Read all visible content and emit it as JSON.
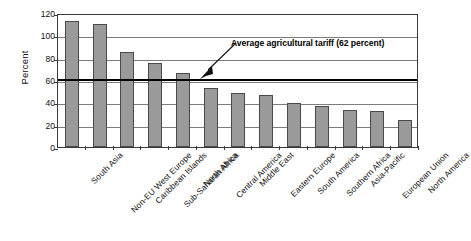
{
  "chart_data": {
    "type": "bar",
    "title": "",
    "xlabel": "",
    "ylabel": "Percent",
    "ylim": [
      0,
      120
    ],
    "ystep": 20,
    "yticks": [
      120,
      100,
      80,
      60,
      40,
      20,
      0
    ],
    "grid": true,
    "legend": null,
    "categories": [
      "South Asia",
      "Non-EU West Europe",
      "Caribbean Islands",
      "Sub-Saharan Africa",
      "North Africa",
      "Central America",
      "Middle East",
      "Eastern Europe",
      "South America",
      "Southern Africa",
      "Asia-Pacific",
      "European Union",
      "North America"
    ],
    "values": [
      113,
      110,
      85,
      75,
      66,
      53,
      48,
      47,
      39,
      37,
      33,
      32,
      24
    ],
    "bar_color": "#9a9a9a",
    "bar_edge_color": "#4a4a4a",
    "reference_line": {
      "value": 62,
      "label": "Average agricultural tariff (62 percent)",
      "color": "#000000"
    },
    "annotations": [
      {
        "name": "average-tariff-annotation",
        "text": "Average agricultural tariff (62 percent)",
        "points_to": 62
      }
    ]
  },
  "axis": {
    "y_title": "Percent",
    "y_ticks": [
      "120",
      "100",
      "80",
      "60",
      "40",
      "20",
      "0"
    ]
  },
  "annotation": {
    "text": "Average agricultural tariff (62 percent)"
  },
  "caption": {
    "text": ""
  }
}
